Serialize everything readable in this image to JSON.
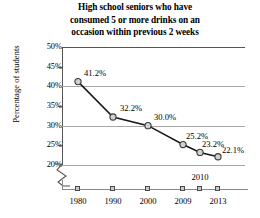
{
  "chart_data": {
    "type": "line",
    "title": "High school seniors who have consumed 5 or more drinks on an occasion within previous 2 weeks",
    "title_lines": [
      "High school seniors who have",
      "consumed 5 or more drinks on an",
      "occasion within previous 2 weeks"
    ],
    "xlabel": "",
    "ylabel": "Percentage of students",
    "categories": [
      "1980",
      "1990",
      "2000",
      "2009",
      "2010",
      "2013"
    ],
    "x_tick_labels": [
      "1980",
      "1990",
      "2000",
      "2009",
      "2010",
      "2013"
    ],
    "x_label_placement": [
      "below",
      "below",
      "below",
      "below",
      "above",
      "below"
    ],
    "values": [
      41.2,
      32.2,
      30.0,
      25.2,
      23.2,
      22.1
    ],
    "point_labels": [
      "41.2%",
      "32.2%",
      "30.0%",
      "25.2%",
      "23.2%",
      "22.1%"
    ],
    "y_tick_labels": [
      "50%",
      "45%",
      "40%",
      "35%",
      "30%",
      "25%",
      "20%"
    ],
    "y_tick_values": [
      50,
      45,
      40,
      35,
      30,
      25,
      20
    ],
    "gridline_values": [
      40,
      30,
      20
    ],
    "ylim": [
      20,
      50
    ],
    "grid": true,
    "axis_break": true,
    "legend": "none",
    "marker": "circle",
    "colors": {
      "line": "#1a1a1a",
      "marker_fill": "#d0d0d0",
      "marker_stroke": "#3a3a3a",
      "gridline": "#a8a8a8",
      "axis": "#555555",
      "text": "#000000",
      "background": "#ffffff"
    }
  }
}
